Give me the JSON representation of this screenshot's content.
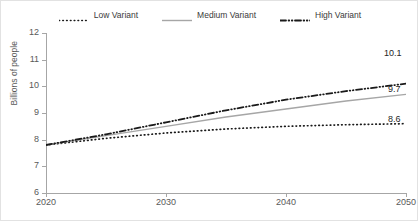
{
  "chart_data": {
    "type": "line",
    "title": "",
    "subtitle": "",
    "xlabel": "",
    "ylabel": "Billions of people",
    "xlim": [
      2020,
      2050
    ],
    "ylim": [
      6,
      12
    ],
    "x_ticks": [
      2020,
      2030,
      2040,
      2050
    ],
    "y_ticks": [
      6,
      7,
      8,
      9,
      10,
      11,
      12
    ],
    "grid": false,
    "legend_position": "top-center",
    "x": [
      2020,
      2025,
      2030,
      2035,
      2040,
      2045,
      2050
    ],
    "series": [
      {
        "name": "Low Variant",
        "style": "dotted",
        "color": "#1a1a1a",
        "values": [
          7.8,
          8.05,
          8.25,
          8.4,
          8.5,
          8.56,
          8.6
        ],
        "end_label": "8.6"
      },
      {
        "name": "Medium Variant",
        "style": "solid",
        "color": "#a6a6a6",
        "values": [
          7.8,
          8.15,
          8.5,
          8.85,
          9.15,
          9.45,
          9.7
        ],
        "end_label": "9.7"
      },
      {
        "name": "High Variant",
        "style": "dash-dot",
        "color": "#1a1a1a",
        "values": [
          7.8,
          8.2,
          8.65,
          9.1,
          9.5,
          9.82,
          10.1
        ],
        "end_label": "10.1"
      }
    ],
    "annotations": [
      {
        "text": "10.1",
        "series": "High Variant",
        "at_x": 2050
      },
      {
        "text": "9.7",
        "series": "Medium Variant",
        "at_x": 2050
      },
      {
        "text": "8.6",
        "series": "Low Variant",
        "at_x": 2050
      }
    ]
  },
  "legend": {
    "items": [
      {
        "label": "Low Variant",
        "key": "dotted-line-key"
      },
      {
        "label": "Medium Variant",
        "key": "solid-line-key"
      },
      {
        "label": "High Variant",
        "key": "dash-dot-line-key"
      }
    ]
  },
  "axes": {
    "y_title": "Billions of people",
    "y_labels": [
      "12",
      "11",
      "10",
      "9",
      "8",
      "7",
      "6"
    ],
    "x_labels": [
      "2020",
      "2030",
      "2040",
      "2050"
    ]
  },
  "labels": {
    "high_end": "10.1",
    "medium_end": "9.7",
    "low_end": "8.6"
  },
  "colors": {
    "axis": "#a6a6a6",
    "tick_text": "#595959",
    "dark_line": "#1a1a1a",
    "gray_line": "#a6a6a6",
    "background": "#ffffff",
    "frame": "#e2e2e2"
  }
}
